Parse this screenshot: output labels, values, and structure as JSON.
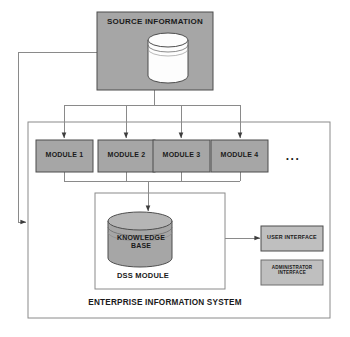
{
  "diagram": {
    "colors": {
      "box_fill": "#a6a6a6",
      "cylinder_fill_source": "#ffffff",
      "cylinder_fill_knowledge": "#a6a6a6",
      "interface_fill": "#bfbfbf",
      "stroke": "#4d4d4d",
      "line": "#808080",
      "text": "#1a1a1a",
      "page_background": "#ffffff"
    },
    "source": {
      "title": "SOURCE INFORMATION",
      "icon": "database-cylinder-icon"
    },
    "modules": [
      {
        "label": "MODULE 1"
      },
      {
        "label": "MODULE 2"
      },
      {
        "label": "MODULE 3"
      },
      {
        "label": "MODULE 4"
      }
    ],
    "modules_ellipsis": "...",
    "dss": {
      "knowledge_base_label": "KNOWLEDGE\nBASE",
      "module_label": "DSS MODULE",
      "icon": "database-cylinder-icon"
    },
    "interfaces": [
      {
        "label": "USER INTERFACE"
      },
      {
        "label": "ADMINISTRATOR\nINTERFACE"
      }
    ],
    "container": {
      "label": "ENTERPRISE INFORMATION SYSTEM"
    }
  }
}
